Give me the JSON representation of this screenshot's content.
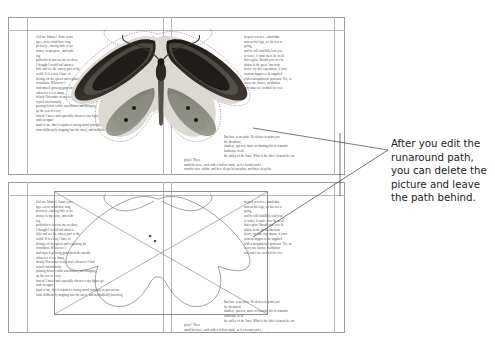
{
  "document": {
    "title": "Runaround path illustration",
    "annotation": {
      "lines": [
        "After you edit the",
        "runaround path,",
        "you can delete the",
        "picture and leave",
        "the path behind."
      ],
      "full_text": "After you edit the runaround path, you can delete the picture and leave the path behind.",
      "text_color": "#1b1b1b"
    }
  },
  "colors": {
    "page_border": "#9a9a9a",
    "guide": "#b9b9b9",
    "body_text": "#2b2b2b",
    "leader_line": "#4a4a4a",
    "path_outline": "#6f6f6f",
    "wing_dark": "#241f1c",
    "wing_mid": "#6d6a62",
    "wing_lower": "#8f9186",
    "wing_edge": "#d8d6cf",
    "body_dark": "#2c2925"
  },
  "panels": [
    {
      "id": "panel-top",
      "name": "page-with-picture-and-runaround",
      "caption": "Page showing the butterfly picture with its runaround path; text wraps around the image.",
      "has_picture": true,
      "has_runaround_path": true,
      "has_empty_picture_box": false
    },
    {
      "id": "panel-bottom",
      "name": "page-with-path-only",
      "caption": "Same page after deleting the picture; the runaround path remains and text still wraps.",
      "has_picture": false,
      "has_runaround_path": true,
      "has_empty_picture_box": true
    }
  ],
  "body_copy": {
    "left_column_lines": [
      "Call me Ishmael.  Some years",
      "ago—never mind how long",
      "precisely—having little or no",
      "money in my purse, and noth-",
      "ing",
      "particular to interest me on shore,",
      "I thought I would sail about a",
      "little and see the watery part of the",
      "world.  It is a way I have of",
      "driving off the spleen and regulating the",
      "circulation.  Whenever I",
      "find myself growing grim about the mouth;",
      "whenever it is a damp,",
      "drizzly November in my soul; whenever I find",
      "myself involuntarily",
      "pausing before coffin warehouses, and bringing",
      "up the rear of every",
      "funeral I meet; and especially whenever my hypos get",
      "such an upper",
      "hand of me, that it requires a strong moral principle to prevent me",
      "from deliberately stepping into the street, and methodically knocking"
    ],
    "right_column_lines": [
      "deepest reveries—stand that",
      "man on his legs, set his feet a-",
      "going,",
      "and he will infallibly lead you",
      "to water, if water there be in all",
      "that region.  Should you ever be",
      "athirst in the great American",
      "desert, try this experiment, if your",
      "caravan happen to be supplied",
      "with a metaphysical professor.  Yes, as",
      "every one knows, meditation",
      "and water are wedded for ever.",
      "",
      "But here is an artist.  He desires to paint you",
      "the dreamiest,",
      "shadiest, quietest, most en-chanting bit of romantic",
      "landscape in all",
      "the valley of the Saco.  What is the chief element he em-",
      "ploys?  There",
      "stand his trees, each with a hollow trunk, as if a hermit and a",
      "crucifix were within; and here sleeps his meadow, and there sleep his"
    ]
  }
}
